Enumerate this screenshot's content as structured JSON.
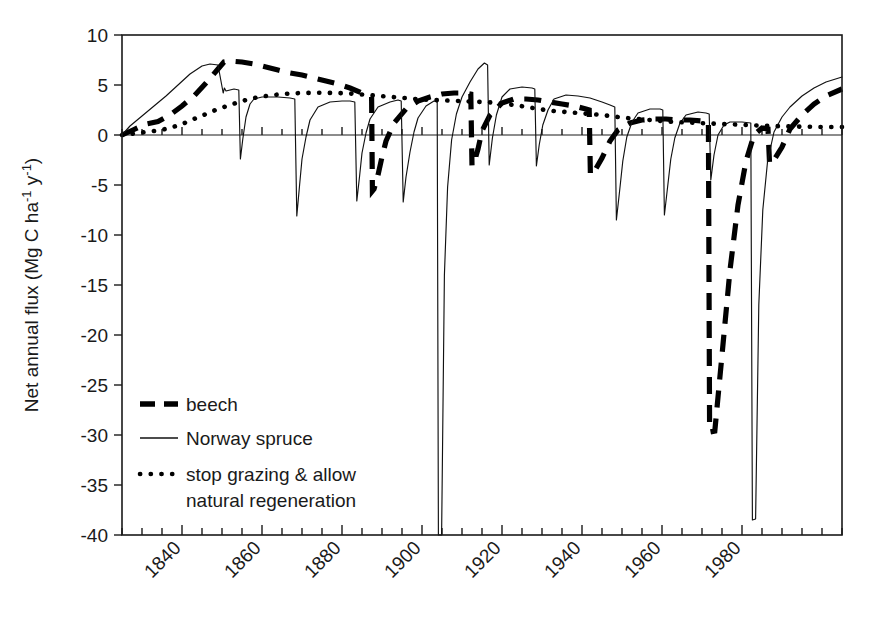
{
  "chart_data": {
    "type": "line",
    "title": "",
    "xlabel": "",
    "ylabel": "Net annual flux  (Mg C ha-1 y-1)",
    "ylabel_parts": {
      "pre": "Net annual flux  (Mg C ha",
      "sup1": "-1",
      "mid": " y",
      "sup2": "-1",
      "post": ")"
    },
    "xlim": [
      1825,
      2005
    ],
    "ylim": [
      -40,
      10
    ],
    "y_ticks": [
      10,
      5,
      0,
      -5,
      -10,
      -15,
      -20,
      -25,
      -30,
      -35,
      -40
    ],
    "y_tick_labels": [
      "10",
      "5",
      "0",
      "-5",
      "-10",
      "-15",
      "-20",
      "-25",
      "-30",
      "-35",
      "-40"
    ],
    "x_ticks_major": [
      1840,
      1860,
      1880,
      1900,
      1920,
      1940,
      1960,
      1980
    ],
    "x_tick_labels": [
      "1840",
      "1860",
      "1880",
      "1900",
      "1920",
      "1940",
      "1960",
      "1980"
    ],
    "x_tick_minor_interval": 5,
    "x_tick_label_rotation": -45,
    "grid": false,
    "zero_line": true,
    "legend_position": "lower-left-inside",
    "legend": [
      {
        "label": "beech",
        "style": "thick-dashed"
      },
      {
        "label": "Norway spruce",
        "style": "thin-solid"
      },
      {
        "label": "stop grazing & allow natural regeneration",
        "label_line1": "stop grazing & allow",
        "label_line2": "natural regeneration",
        "style": "dotted"
      }
    ],
    "series": [
      {
        "name": "beech",
        "style": "thick-dashed",
        "points": [
          [
            1825,
            0.0
          ],
          [
            1828,
            0.55
          ],
          [
            1831,
            1.1
          ],
          [
            1834,
            1.35
          ],
          [
            1837,
            2.0
          ],
          [
            1840,
            2.9
          ],
          [
            1843,
            3.9
          ],
          [
            1846,
            5.2
          ],
          [
            1849,
            6.6
          ],
          [
            1850.5,
            7.3
          ],
          [
            1852,
            7.4
          ],
          [
            1855,
            7.3
          ],
          [
            1858,
            7.1
          ],
          [
            1861,
            6.8
          ],
          [
            1864,
            6.5
          ],
          [
            1867,
            6.2
          ],
          [
            1870,
            6.0
          ],
          [
            1873,
            5.7
          ],
          [
            1876,
            5.4
          ],
          [
            1879,
            5.1
          ],
          [
            1882,
            4.7
          ],
          [
            1885,
            4.2
          ],
          [
            1887,
            3.9
          ],
          [
            1887.4,
            3.8
          ],
          [
            1887.6,
            -5.6
          ],
          [
            1888,
            -5.4
          ],
          [
            1889,
            -4.0
          ],
          [
            1890,
            -2.2
          ],
          [
            1891,
            -0.6
          ],
          [
            1893,
            1.2
          ],
          [
            1896,
            2.6
          ],
          [
            1899,
            3.4
          ],
          [
            1902,
            3.8
          ],
          [
            1905,
            4.1
          ],
          [
            1908,
            4.2
          ],
          [
            1911,
            4.2
          ],
          [
            1912.2,
            4.1
          ],
          [
            1912.5,
            -3.1
          ],
          [
            1913,
            -2.8
          ],
          [
            1914,
            -1.4
          ],
          [
            1915,
            0.4
          ],
          [
            1917,
            2.0
          ],
          [
            1920,
            3.2
          ],
          [
            1923,
            3.6
          ],
          [
            1926,
            3.6
          ],
          [
            1929,
            3.5
          ],
          [
            1932,
            3.3
          ],
          [
            1935,
            3.1
          ],
          [
            1938,
            2.9
          ],
          [
            1941,
            2.6
          ],
          [
            1941.8,
            2.5
          ],
          [
            1942.1,
            -4.0
          ],
          [
            1943,
            -3.7
          ],
          [
            1945,
            -2.3
          ],
          [
            1947,
            -0.6
          ],
          [
            1949,
            0.5
          ],
          [
            1952,
            1.2
          ],
          [
            1955,
            1.5
          ],
          [
            1958,
            1.6
          ],
          [
            1961,
            1.6
          ],
          [
            1964,
            1.5
          ],
          [
            1967,
            1.5
          ],
          [
            1970,
            1.4
          ],
          [
            1971.6,
            1.3
          ],
          [
            1971.9,
            -29.7
          ],
          [
            1973.2,
            -29.6
          ],
          [
            1975,
            -22.0
          ],
          [
            1977,
            -13.5
          ],
          [
            1979,
            -7.0
          ],
          [
            1981,
            -2.6
          ],
          [
            1983,
            0.0
          ],
          [
            1985,
            0.7
          ],
          [
            1986.5,
            0.6
          ],
          [
            1986.9,
            -2.9
          ],
          [
            1988,
            -2.5
          ],
          [
            1990,
            -1.2
          ],
          [
            1992,
            0.6
          ],
          [
            1995,
            2.0
          ],
          [
            1998,
            3.1
          ],
          [
            2001,
            3.9
          ],
          [
            2005,
            4.6
          ]
        ]
      },
      {
        "name": "Norway spruce",
        "style": "thin-solid",
        "points": [
          [
            1825,
            0.0
          ],
          [
            1827,
            0.9
          ],
          [
            1830,
            1.9
          ],
          [
            1833,
            2.9
          ],
          [
            1836,
            3.9
          ],
          [
            1839,
            5.0
          ],
          [
            1842,
            6.1
          ],
          [
            1845,
            6.9
          ],
          [
            1847,
            7.1
          ],
          [
            1849,
            7.0
          ],
          [
            1850.3,
            4.2
          ],
          [
            1850.6,
            4.7
          ],
          [
            1851,
            4.4
          ],
          [
            1852,
            4.5
          ],
          [
            1853,
            4.6
          ],
          [
            1854.2,
            4.5
          ],
          [
            1854.6,
            -2.4
          ],
          [
            1855.2,
            -0.4
          ],
          [
            1856,
            1.8
          ],
          [
            1857,
            3.1
          ],
          [
            1858,
            3.6
          ],
          [
            1860,
            3.8
          ],
          [
            1864,
            3.8
          ],
          [
            1867,
            3.7
          ],
          [
            1868.2,
            3.6
          ],
          [
            1868.7,
            -8.1
          ],
          [
            1869.4,
            -5.0
          ],
          [
            1870,
            -2.4
          ],
          [
            1871,
            -0.2
          ],
          [
            1872,
            1.5
          ],
          [
            1874,
            2.8
          ],
          [
            1877,
            3.3
          ],
          [
            1880,
            3.4
          ],
          [
            1882,
            3.4
          ],
          [
            1883.2,
            3.3
          ],
          [
            1883.7,
            -6.6
          ],
          [
            1884.4,
            -4.1
          ],
          [
            1885,
            -1.8
          ],
          [
            1886,
            0.2
          ],
          [
            1887,
            1.6
          ],
          [
            1889,
            2.8
          ],
          [
            1892,
            3.3
          ],
          [
            1894,
            3.5
          ],
          [
            1894.8,
            3.4
          ],
          [
            1895.3,
            -6.7
          ],
          [
            1896,
            -4.2
          ],
          [
            1897,
            -1.7
          ],
          [
            1898,
            0.3
          ],
          [
            1899,
            1.7
          ],
          [
            1901,
            2.9
          ],
          [
            1903,
            3.4
          ],
          [
            1903.8,
            3.3
          ],
          [
            1904.1,
            -40.0
          ],
          [
            1904.9,
            -40.0
          ],
          [
            1905.6,
            -14.0
          ],
          [
            1906.4,
            -5.2
          ],
          [
            1907.4,
            -0.5
          ],
          [
            1908.6,
            2.1
          ],
          [
            1910,
            3.8
          ],
          [
            1912,
            5.3
          ],
          [
            1914,
            6.6
          ],
          [
            1915.6,
            7.2
          ],
          [
            1916.4,
            7.0
          ],
          [
            1916.8,
            -3.0
          ],
          [
            1917.6,
            -0.3
          ],
          [
            1918.6,
            2.0
          ],
          [
            1920,
            3.8
          ],
          [
            1922,
            4.6
          ],
          [
            1925,
            4.8
          ],
          [
            1927.5,
            4.7
          ],
          [
            1928.2,
            4.6
          ],
          [
            1928.6,
            -3.1
          ],
          [
            1929.3,
            -1.0
          ],
          [
            1930.2,
            1.0
          ],
          [
            1931.5,
            2.5
          ],
          [
            1933,
            3.6
          ],
          [
            1936,
            4.0
          ],
          [
            1939,
            3.9
          ],
          [
            1942,
            3.7
          ],
          [
            1945,
            3.3
          ],
          [
            1947,
            3.0
          ],
          [
            1948.2,
            2.8
          ],
          [
            1948.6,
            -8.5
          ],
          [
            1949.4,
            -5.6
          ],
          [
            1950.2,
            -2.6
          ],
          [
            1951.2,
            -0.2
          ],
          [
            1952.5,
            1.3
          ],
          [
            1954,
            2.2
          ],
          [
            1957,
            2.6
          ],
          [
            1959.5,
            2.6
          ],
          [
            1960.2,
            2.5
          ],
          [
            1960.6,
            -8.0
          ],
          [
            1961.4,
            -5.2
          ],
          [
            1962.2,
            -2.4
          ],
          [
            1963.2,
            -0.3
          ],
          [
            1964.5,
            1.2
          ],
          [
            1966,
            2.0
          ],
          [
            1969,
            2.3
          ],
          [
            1971,
            2.2
          ],
          [
            1971.8,
            2.1
          ],
          [
            1972.2,
            -4.5
          ],
          [
            1973,
            -2.0
          ],
          [
            1974,
            0.0
          ],
          [
            1975.5,
            1.0
          ],
          [
            1977,
            1.3
          ],
          [
            1980,
            1.3
          ],
          [
            1982.2,
            1.2
          ],
          [
            1982.6,
            -38.5
          ],
          [
            1983.4,
            -38.4
          ],
          [
            1984.2,
            -17.0
          ],
          [
            1985.2,
            -7.5
          ],
          [
            1986.4,
            -2.6
          ],
          [
            1988,
            0.3
          ],
          [
            1990,
            1.8
          ],
          [
            1992,
            2.8
          ],
          [
            1995,
            3.9
          ],
          [
            1998,
            4.7
          ],
          [
            2001,
            5.3
          ],
          [
            2005,
            5.8
          ]
        ]
      },
      {
        "name": "stop grazing & allow natural regeneration",
        "style": "dotted",
        "points": [
          [
            1825,
            0.0
          ],
          [
            1828,
            0.15
          ],
          [
            1831,
            0.3
          ],
          [
            1834,
            0.45
          ],
          [
            1837,
            0.7
          ],
          [
            1840,
            1.1
          ],
          [
            1843,
            1.6
          ],
          [
            1846,
            2.1
          ],
          [
            1849,
            2.6
          ],
          [
            1852,
            3.0
          ],
          [
            1855,
            3.4
          ],
          [
            1858,
            3.7
          ],
          [
            1861,
            3.9
          ],
          [
            1864,
            4.05
          ],
          [
            1867,
            4.15
          ],
          [
            1870,
            4.2
          ],
          [
            1873,
            4.22
          ],
          [
            1876,
            4.22
          ],
          [
            1879,
            4.2
          ],
          [
            1882,
            4.15
          ],
          [
            1885,
            4.05
          ],
          [
            1888,
            3.95
          ],
          [
            1891,
            3.85
          ],
          [
            1894,
            3.75
          ],
          [
            1897,
            3.65
          ],
          [
            1900,
            3.55
          ],
          [
            1903,
            3.5
          ],
          [
            1906,
            3.45
          ],
          [
            1909,
            3.4
          ],
          [
            1912,
            3.35
          ],
          [
            1915,
            3.3
          ],
          [
            1918,
            3.25
          ],
          [
            1921,
            3.1
          ],
          [
            1924,
            2.95
          ],
          [
            1927,
            2.75
          ],
          [
            1930,
            2.55
          ],
          [
            1933,
            2.4
          ],
          [
            1936,
            2.3
          ],
          [
            1939,
            2.2
          ],
          [
            1942,
            2.1
          ],
          [
            1945,
            2.0
          ],
          [
            1948,
            1.85
          ],
          [
            1951,
            1.7
          ],
          [
            1954,
            1.6
          ],
          [
            1957,
            1.5
          ],
          [
            1960,
            1.4
          ],
          [
            1963,
            1.3
          ],
          [
            1966,
            1.25
          ],
          [
            1969,
            1.2
          ],
          [
            1972,
            1.15
          ],
          [
            1975,
            1.1
          ],
          [
            1978,
            1.05
          ],
          [
            1981,
            1.0
          ],
          [
            1984,
            0.95
          ],
          [
            1987,
            0.9
          ],
          [
            1990,
            0.88
          ],
          [
            1993,
            0.85
          ],
          [
            1996,
            0.83
          ],
          [
            1999,
            0.8
          ],
          [
            2002,
            0.8
          ],
          [
            2005,
            0.8
          ]
        ]
      }
    ]
  }
}
